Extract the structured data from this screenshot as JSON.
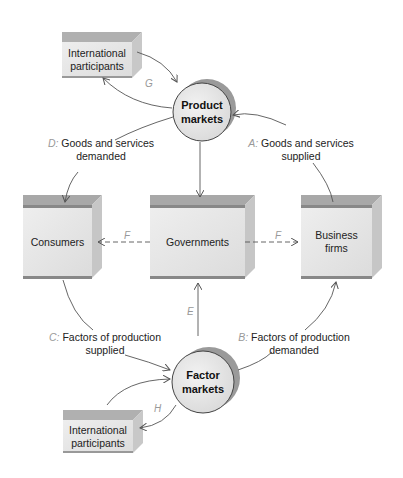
{
  "diagram": {
    "nodes": {
      "intl_top": {
        "label_line1": "International",
        "label_line2": "participants"
      },
      "product_markets": {
        "label_line1": "Product",
        "label_line2": "markets"
      },
      "consumers": {
        "label": "Consumers"
      },
      "governments": {
        "label": "Governments"
      },
      "business_firms": {
        "label_line1": "Business",
        "label_line2": "firms"
      },
      "factor_markets": {
        "label_line1": "Factor",
        "label_line2": "markets"
      },
      "intl_bottom": {
        "label_line1": "International",
        "label_line2": "participants"
      }
    },
    "flows": {
      "A": {
        "key": "A:",
        "line1": "Goods and services",
        "line2": "supplied"
      },
      "B": {
        "key": "B:",
        "line1": "Factors of production",
        "line2": "demanded"
      },
      "C": {
        "key": "C:",
        "line1": "Factors of production",
        "line2": "supplied"
      },
      "D": {
        "key": "D:",
        "line1": "Goods and services",
        "line2": "demanded"
      },
      "E": {
        "key": "E"
      },
      "F_left": {
        "key": "F"
      },
      "F_right": {
        "key": "F"
      },
      "G": {
        "key": "G"
      },
      "H": {
        "key": "H"
      }
    },
    "colors": {
      "box_face": "#e6e6e6",
      "box_top": "#a8a8a8",
      "box_side": "#c4c4c4",
      "circle_fill": "#e8e8e8",
      "circle_shadow": "#a0a0a0",
      "line": "#555555",
      "letter": "#999999"
    }
  }
}
